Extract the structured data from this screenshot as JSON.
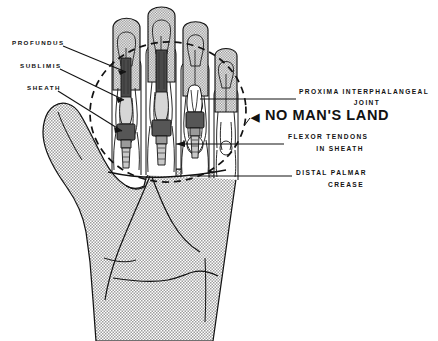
{
  "figure": {
    "background_color": "#ffffff",
    "ink_color": "#121212",
    "skin_fill": "#b4b4b4",
    "tendon_fill": "#5a5a5a"
  },
  "labels": {
    "left": [
      {
        "id": "profundus",
        "text": "PROFUNDUS"
      },
      {
        "id": "sublimis",
        "text": "SUBLIMIS"
      },
      {
        "id": "sheath",
        "text": "SHEATH"
      }
    ],
    "right": {
      "pip_joint_line1": "PROXIMA   INTERPHALANGEAL",
      "pip_joint_line2": "JOINT",
      "no_mans_land": "NO MAN'S LAND",
      "arrow_glyph": "◀",
      "flexor_line1": "FLEXOR  TENDONS",
      "flexor_line2": "IN  SHEATH",
      "crease_line1": "DISTAL  PALMAR",
      "crease_line2": "CREASE"
    }
  },
  "annotations": {
    "zone_shape": "dashed-ellipse",
    "zone_name": "no-mans-land-ellipse",
    "finger_count": 4,
    "thumb": true,
    "tendon_units": 3
  }
}
